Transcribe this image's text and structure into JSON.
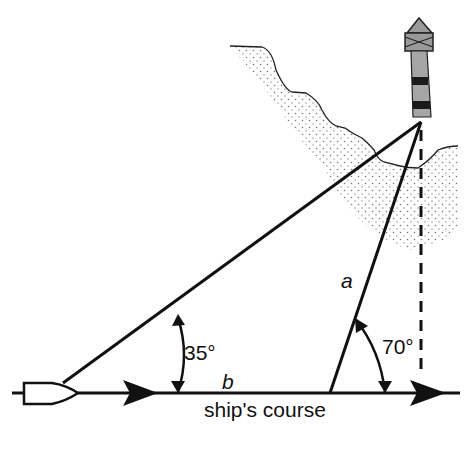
{
  "diagram": {
    "labels": {
      "angle_near": "35°",
      "angle_far": "70°",
      "side_a": "a",
      "side_b": "b",
      "course": "ship's course"
    },
    "elements": [
      "ship",
      "lighthouse",
      "coastline",
      "course-line",
      "sight-line-1",
      "sight-line-2",
      "perpendicular-dashed-line"
    ],
    "colors": {
      "ink": "#111111",
      "lighthouse_fill": "#9a9a9a",
      "band": "#1a1a1a",
      "stipple": "#777777"
    }
  }
}
